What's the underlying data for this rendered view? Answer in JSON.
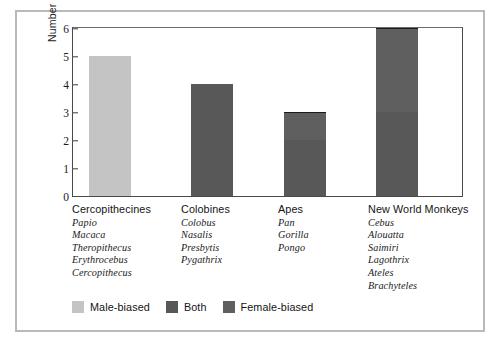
{
  "chart_data": {
    "type": "bar",
    "title": "",
    "xlabel": "",
    "ylabel": "Number of Genera",
    "ylim": [
      0,
      6
    ],
    "yticks": [
      0,
      1,
      2,
      3,
      4,
      5,
      6
    ],
    "grid": false,
    "stacked": true,
    "legend_position": "bottom-left",
    "categories": [
      "Cercopithecines",
      "Colobines",
      "Apes",
      "New World Monkeys"
    ],
    "series": [
      {
        "name": "Male-biased",
        "color": "#c4c4c4",
        "values": [
          5,
          0,
          0,
          0
        ]
      },
      {
        "name": "Both",
        "color": "#585858",
        "values": [
          0,
          4,
          2,
          3
        ]
      },
      {
        "name": "Female-biased",
        "color": "#5f5f5f",
        "values": [
          0,
          0,
          1,
          3
        ]
      }
    ],
    "totals": [
      5,
      4,
      3,
      6
    ]
  },
  "axis": {
    "y_title": "Number of Genera",
    "ticks": [
      "6",
      "5",
      "4",
      "3",
      "2",
      "1",
      "0"
    ]
  },
  "groups": [
    {
      "name": "Cercopithecines",
      "genera": [
        "Papio",
        "Macaca",
        "Theropithecus",
        "Erythrocebus",
        "Cercopithecus"
      ]
    },
    {
      "name": "Colobines",
      "genera": [
        "Colobus",
        "Nasalis",
        "Presbytis",
        "Pygathrix"
      ]
    },
    {
      "name": "Apes",
      "genera": [
        "Pan",
        "Gorilla",
        "Pongo"
      ]
    },
    {
      "name": "New World Monkeys",
      "genera": [
        "Cebus",
        "Alouatta",
        "Saimiri",
        "Lagothrix",
        "Ateles",
        "Brachyteles"
      ]
    }
  ],
  "legend": [
    {
      "label": "Male-biased",
      "color": "#c4c4c4"
    },
    {
      "label": "Both",
      "color": "#585858"
    },
    {
      "label": "Female-biased",
      "color": "#5f5f5f"
    }
  ],
  "colors": {
    "male_biased": "#c4c4c4",
    "both": "#585858",
    "female_biased": "#5f5f5f",
    "axis": "#4a4a4a",
    "outer_frame": "#b9b9b9",
    "background": "#ffffff"
  }
}
